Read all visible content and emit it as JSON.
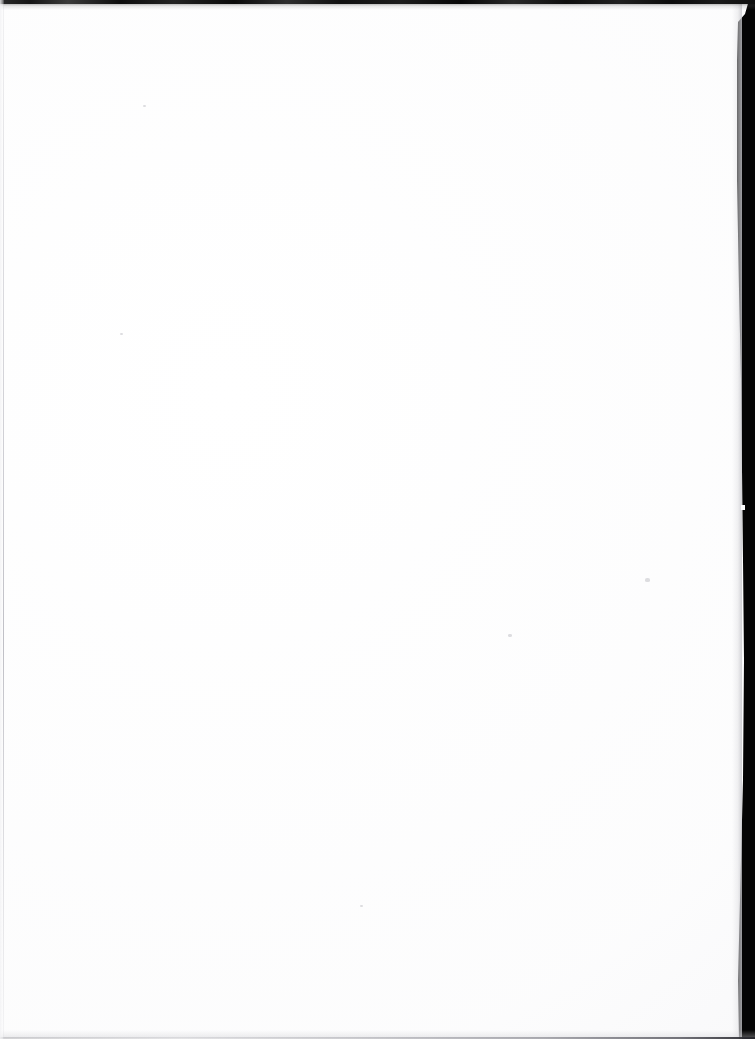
{
  "document": {
    "kind": "scanned-page",
    "page_content": "",
    "page_state_label": "blank page",
    "orientation": "portrait",
    "width_px": 755,
    "height_px": 1039,
    "text_blocks": [],
    "headings": [],
    "figures": [],
    "tables": [],
    "page_number": ""
  },
  "colors": {
    "paper": "#ffffff",
    "scanner_background": "#050505",
    "top_edge_shadow": "#151515",
    "bottom_edge_line": "#8c8c94",
    "left_edge_line": "#bababf",
    "speck": "#b0b0b8"
  },
  "artifacts": {
    "top_edge": {
      "name": "top scanner shadow band",
      "y_px": 0,
      "height_px": 4,
      "description": "irregular dark band spanning full width"
    },
    "right_edge": {
      "name": "right scanner background band",
      "description": "black region beyond the slanted page edge",
      "x_at_top_px": 748,
      "x_at_upper_px": 737,
      "x_at_middle_px": 743,
      "x_at_bottom_px": 738
    },
    "bottom_edge": {
      "name": "bottom scan line",
      "height_px": 2,
      "description": "faint grey line darkening toward the right"
    },
    "left_edge": {
      "name": "left page edge rule",
      "x_px": 3,
      "width_px": 1,
      "description": "barely visible light grey vertical line"
    },
    "specks": [
      {
        "name": "dust-speck-upper-right",
        "x": 645,
        "y": 578,
        "w": 5,
        "h": 4
      },
      {
        "name": "dust-speck-center-right",
        "x": 508,
        "y": 634,
        "w": 4,
        "h": 3
      },
      {
        "name": "dust-speck-upper-left",
        "x": 143,
        "y": 105,
        "w": 3,
        "h": 2
      },
      {
        "name": "dust-speck-lower-left",
        "x": 120,
        "y": 333,
        "w": 3,
        "h": 2
      },
      {
        "name": "dust-speck-lower-center",
        "x": 360,
        "y": 905,
        "w": 3,
        "h": 2
      }
    ]
  }
}
